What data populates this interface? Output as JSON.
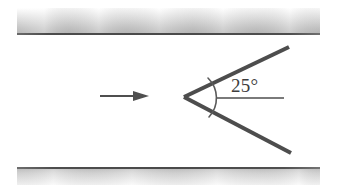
{
  "figure": {
    "background_color": "#ffffff",
    "width": 337,
    "height": 185
  },
  "walls": {
    "top": {
      "name": "upper channel wall",
      "x": 17,
      "y": 8,
      "width": 303,
      "height": 25,
      "fill_light": "#ffffff",
      "fill_dark": "#b9b9b9",
      "edge_line_color": "#4c4c4c",
      "edge_line_thickness": 2
    },
    "bottom": {
      "name": "lower channel wall",
      "x": 17,
      "y": 167,
      "width": 303,
      "height": 18,
      "fill_light": "#ffffff",
      "fill_dark": "#c3c3c3",
      "edge_line_color": "#4c4c4c",
      "edge_line_thickness": 2
    }
  },
  "flow_arrow": {
    "name": "flow direction arrow",
    "x_start": 100,
    "x_end": 149,
    "y": 96,
    "shaft_thickness": 2,
    "head_length": 16,
    "head_half_width": 5,
    "color": "#4f4f4f"
  },
  "wedge": {
    "name": "wedge body",
    "apex_x": 184,
    "apex_y": 97,
    "upper_tip_x": 289,
    "upper_tip_y": 47,
    "lower_tip_x": 291,
    "lower_tip_y": 153,
    "stroke_color": "#4d4d4d",
    "stroke_width": 4
  },
  "angle_marker": {
    "name": "wedge half-angle marker",
    "arc_radius": 28,
    "arc_start_x": 208,
    "arc_start_y": 78,
    "arc_end_x": 209,
    "arc_end_y": 117,
    "arc_color": "#5a5a5a",
    "arc_width": 1.6,
    "reference_line": {
      "x_start": 216,
      "x_end": 284,
      "y": 98,
      "color": "#5a5a5a",
      "thickness": 1.6
    },
    "label": "25°",
    "label_x": 231,
    "label_y": 76,
    "label_color": "#3d3d3d",
    "label_font_size": 19
  },
  "colors": {
    "ink": "#4d4d4d",
    "wall_shade": "#bdbdbd",
    "paper": "#ffffff"
  }
}
